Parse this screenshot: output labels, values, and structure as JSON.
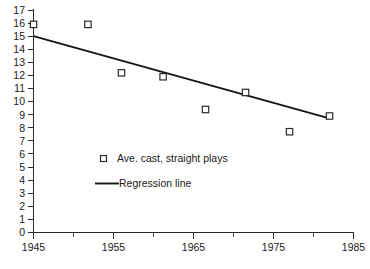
{
  "chart_data": {
    "type": "scatter",
    "title": "",
    "subtitle": "",
    "xlabel": "",
    "ylabel": "",
    "xlim": [
      1945,
      1985
    ],
    "ylim": [
      0,
      17
    ],
    "grid": false,
    "legend_position": "inside-left",
    "x_ticks_major": [
      1945,
      1955,
      1965,
      1975,
      1985
    ],
    "x_ticks_minor": [
      1950,
      1960,
      1970,
      1980
    ],
    "y_ticks": [
      0,
      1,
      2,
      3,
      4,
      5,
      6,
      7,
      8,
      9,
      10,
      11,
      12,
      13,
      14,
      15,
      16,
      17
    ],
    "series": [
      {
        "name": "Ave. cast, straight plays",
        "type": "scatter",
        "marker": "open-square",
        "color": "#2b2b2b",
        "points": [
          {
            "x": 1945.0,
            "y": 15.9
          },
          {
            "x": 1951.8,
            "y": 15.9
          },
          {
            "x": 1956.0,
            "y": 12.2
          },
          {
            "x": 1961.2,
            "y": 11.9
          },
          {
            "x": 1966.5,
            "y": 9.4
          },
          {
            "x": 1971.5,
            "y": 10.7
          },
          {
            "x": 1977.0,
            "y": 7.7
          },
          {
            "x": 1982.0,
            "y": 8.9
          }
        ]
      },
      {
        "name": "Regression line",
        "type": "line",
        "color": "#161616",
        "points": [
          {
            "x": 1945.0,
            "y": 15.0
          },
          {
            "x": 1982.1,
            "y": 8.7
          }
        ]
      }
    ],
    "legend": [
      {
        "label": "Ave. cast, straight plays",
        "marker": "open-square"
      },
      {
        "label": "Regression line",
        "marker": "line"
      }
    ],
    "x_tick_labels": [
      "1945",
      "1955",
      "1965",
      "1975",
      "1985"
    ],
    "y_tick_labels": [
      "0",
      "1",
      "2",
      "3",
      "4",
      "5",
      "6",
      "7",
      "8",
      "9",
      "10",
      "11",
      "12",
      "13",
      "14",
      "15",
      "16",
      "17"
    ]
  },
  "axes": {
    "y_label_0": "0",
    "y_label_1": "1",
    "y_label_2": "2",
    "y_label_3": "3",
    "y_label_4": "4",
    "y_label_5": "5",
    "y_label_6": "6",
    "y_label_7": "7",
    "y_label_8": "8",
    "y_label_9": "9",
    "y_label_10": "10",
    "y_label_11": "11",
    "y_label_12": "12",
    "y_label_13": "13",
    "y_label_14": "14",
    "y_label_15": "15",
    "y_label_16": "16",
    "y_label_17": "17",
    "x_label_1945": "1945",
    "x_label_1955": "1955",
    "x_label_1965": "1965",
    "x_label_1975": "1975",
    "x_label_1985": "1985"
  },
  "legend": {
    "entry_scatter": "Ave. cast, straight plays",
    "entry_line": "Regression line"
  },
  "colors": {
    "axis": "#2b2b2b",
    "marker_stroke": "#2b2b2b",
    "marker_fill": "#ffffff",
    "regression_line": "#161616",
    "text": "#1a1a1a",
    "background": "#ffffff"
  }
}
